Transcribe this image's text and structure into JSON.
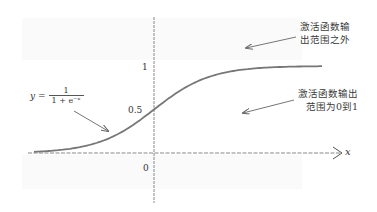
{
  "figure": {
    "formula": {
      "lhs": "y =",
      "numerator": "1",
      "denominator": "1 + e⁻ˣ"
    },
    "axis": {
      "x_label": "x",
      "y_ticks": [
        "1",
        "0.5",
        "0"
      ]
    },
    "annotations": [
      {
        "id": "outside-range",
        "lines": [
          "激活函数输",
          "出范围之外"
        ]
      },
      {
        "id": "inside-range",
        "lines": [
          "激活函数输出",
          "范围为0到1"
        ]
      }
    ],
    "colors": {
      "curve": "#777777",
      "axis": "#888888",
      "text": "#333333",
      "arrow": "#666666"
    }
  },
  "chart_data": {
    "type": "line",
    "title": "",
    "function": "y = 1 / (1 + e^-x)",
    "xlabel": "x",
    "ylabel": "",
    "x": [
      -6,
      -5,
      -4,
      -3,
      -2,
      -1,
      0,
      1,
      2,
      3,
      4,
      5,
      6
    ],
    "series": [
      {
        "name": "sigmoid",
        "values": [
          0.0025,
          0.0067,
          0.018,
          0.047,
          0.119,
          0.269,
          0.5,
          0.731,
          0.881,
          0.953,
          0.982,
          0.993,
          0.9975
        ]
      }
    ],
    "xlim": [
      -6.5,
      8
    ],
    "ylim": [
      -0.25,
      1.35
    ],
    "yticks": [
      0,
      0.5,
      1
    ],
    "grid": false,
    "legend": "none"
  }
}
